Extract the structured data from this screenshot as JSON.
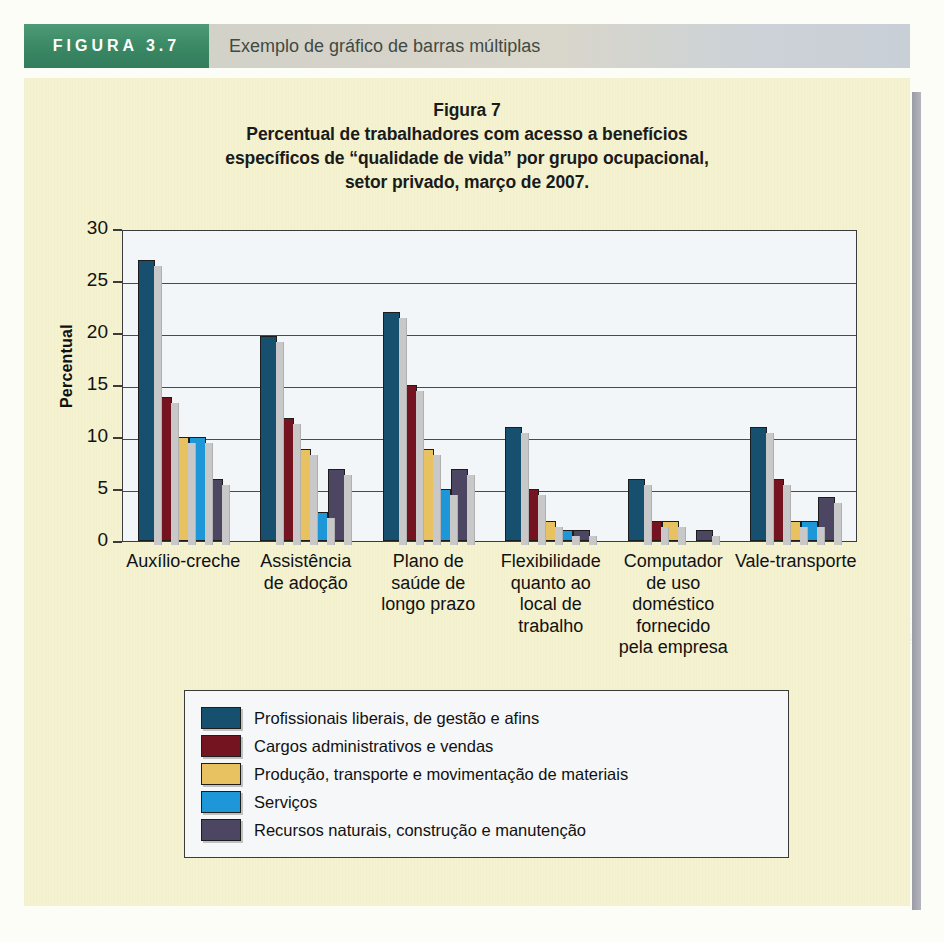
{
  "figure_header": {
    "tag": "FIGURA 3.7",
    "caption": "Exemplo de gráfico de barras múltiplas"
  },
  "chart_data": {
    "type": "bar",
    "title": "Figura 7",
    "subtitle_lines": [
      "Percentual de trabalhadores com acesso a benefícios",
      "específicos de “qualidade de vida” por grupo ocupacional,",
      "setor privado, março de 2007."
    ],
    "xlabel": "",
    "ylabel": "Percentual",
    "ylim": [
      0,
      30
    ],
    "yticks": [
      0,
      5,
      10,
      15,
      20,
      25,
      30
    ],
    "ytick_labels": [
      "0",
      "5",
      "10",
      "15",
      "20",
      "25",
      "30"
    ],
    "grid": true,
    "legend_position": "below",
    "categories": [
      "Auxílio-creche",
      "Assistência de adoção",
      "Plano de saúde de longo prazo",
      "Flexibilidade quanto ao local de trabalho",
      "Computador de uso doméstico fornecido pela empresa",
      "Vale-transporte"
    ],
    "category_lines": [
      [
        "Auxílio-creche"
      ],
      [
        "Assistência",
        "de adoção"
      ],
      [
        "Plano de",
        "saúde de",
        "longo prazo"
      ],
      [
        "Flexibilidade",
        "quanto ao",
        "local de",
        "trabalho"
      ],
      [
        "Computador",
        "de uso",
        "doméstico",
        "fornecido",
        "pela empresa"
      ],
      [
        "Vale-transporte"
      ]
    ],
    "series": [
      {
        "name": "Profissionais liberais, de gestão e afins",
        "color": "#17506e",
        "values": [
          27.0,
          19.7,
          22.0,
          11.0,
          6.0,
          11.0
        ]
      },
      {
        "name": "Cargos administrativos e vendas",
        "color": "#731420",
        "values": [
          13.8,
          11.8,
          15.0,
          5.0,
          1.9,
          6.0
        ]
      },
      {
        "name": "Produção, transporte e movimentação de materiais",
        "color": "#e8c261",
        "values": [
          10.0,
          8.8,
          8.8,
          1.9,
          1.9,
          1.9
        ]
      },
      {
        "name": "Serviços",
        "color": "#1d97d8",
        "values": [
          10.0,
          2.8,
          5.0,
          1.1,
          0.0,
          1.9
        ]
      },
      {
        "name": "Recursos naturais, construção e manutenção",
        "color": "#4c4663",
        "values": [
          6.0,
          6.9,
          6.9,
          1.1,
          1.1,
          4.2
        ]
      }
    ]
  },
  "colors": {
    "band_green": "#3c8a66",
    "panel_cream": "#f4f2cf",
    "plot_bg": "#f3f6f8",
    "axis": "#3b3b3b"
  },
  "ghost_text": [
    "os Estados Unidos, por setor",
    "12.000",
    "70.200",
    "48.000",
    "10.000",
    "14.000",
    "20.000",
    "8.000",
    "Serviços",
    "Produção",
    "Mês",
    "FONTE: De Wan Kwii, Gerald Keller e Brian Warrack,",
    "Duxbury & Company. A reprodução total ou parcial é",
    "Thomson/Cengage Learning.",
    "pacote de software o",
    "computadores apresentam",
    "graficamente conjuntos com",
    "valores apenas. Ele",
    "gráficos de barras",
    "para duas ou mais",
    "em cada categoria",
    "auxiliam o leitor",
    "posicionadas uma",
    "exibe as proporções",
    "indicam as partes",
    "Os gráficos de barras",
    "diferenças em dados",
    "estas, como mostra",
    "de coluna",
    "para comparar",
    "colunas contêm",
    "tamanho da extensão",
    "mesma coluna",
    "Mapas"
  ]
}
